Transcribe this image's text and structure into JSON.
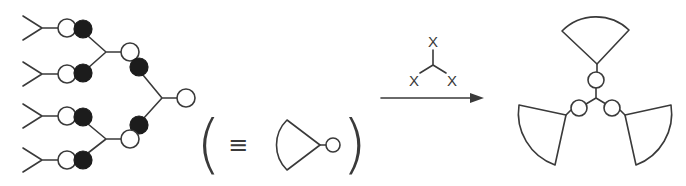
{
  "diagram": {
    "type": "reaction-scheme",
    "left": {
      "name": "dendron",
      "description": "branched dendron: four Y-shaped terminal groups each linked to a white/black bead pair, converging through two generations to a white focal bead",
      "generations": 2,
      "terminal_groups": 4,
      "bead_colors": {
        "filled": "#1c1c1c",
        "open": "#ffffff"
      }
    },
    "equivalence": {
      "open_paren": "(",
      "symbol": "≡",
      "close_paren": ")",
      "shorthand": "sector-shaped dendron with focal bead"
    },
    "reagent": {
      "labels": [
        "X",
        "X",
        "X"
      ],
      "description": "trivalent core X3"
    },
    "arrow": {
      "direction": "right"
    },
    "product": {
      "name": "three-arm dendrimer",
      "arms": 3,
      "description": "three sector-shaped dendrons attached via focal beads to a trivalent core"
    },
    "colors": {
      "stroke": "#3a3a3a",
      "background": "#ffffff"
    }
  }
}
